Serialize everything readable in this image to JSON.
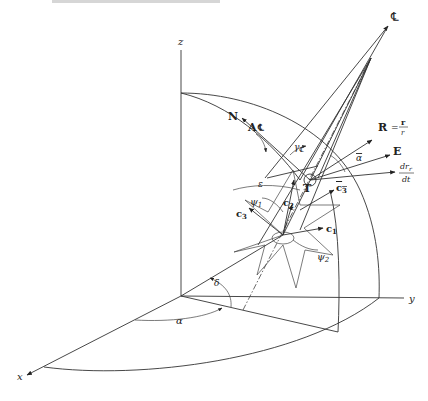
{
  "figure": {
    "axes": {
      "x": "x",
      "y": "y",
      "z": "z"
    },
    "angles": {
      "alpha": "α",
      "delta": "δ",
      "epsilon": "ε",
      "psi1": "ψ",
      "psi1_sub": "1",
      "psi2": "ψ",
      "psi2_sub": "2",
      "gamma_cl": "γ",
      "gamma_sub": "℄",
      "alpha_bar": "α"
    },
    "vectors": {
      "centerline": "℄",
      "N": "N",
      "A_cl": "A",
      "A_cl_sub": "℄",
      "R_label": "R",
      "R_eq": "=",
      "R_num": "r",
      "R_den": "r",
      "E": "E",
      "drr_num": "dr",
      "drr_sub": "r",
      "drr_den": "dt",
      "T": "T",
      "c1": "c",
      "c1_sub": "1",
      "c2": "c",
      "c2_sub": "2",
      "c3_left": "c",
      "c3_left_sub": "3",
      "c3_right": "c",
      "c3_right_sub": "3"
    }
  }
}
